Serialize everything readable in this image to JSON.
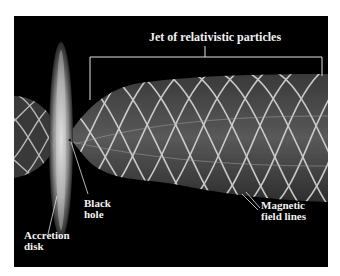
{
  "figure": {
    "title": "Jet of relativistic particles",
    "labels": {
      "black_hole": [
        "Black",
        "hole"
      ],
      "accretion_disk": [
        "Accretion",
        "disk"
      ],
      "magnetic_field_lines": [
        "Magnetic",
        "field lines"
      ]
    },
    "colors": {
      "background": "#000000",
      "page": "#ffffff",
      "text": "#f2f2f2",
      "field_lines": "#d8d8d8",
      "disk_glow": "#cfcfcf"
    }
  }
}
